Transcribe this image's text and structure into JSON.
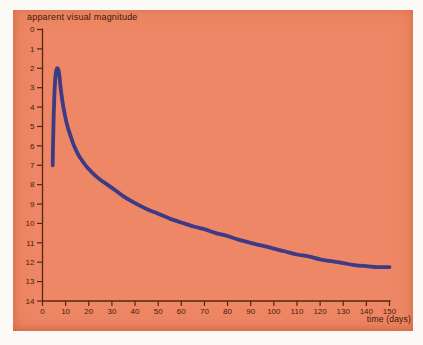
{
  "figure": {
    "page_bg_color": "#fbfaf7",
    "panel_color": "#ee8765",
    "axis_color": "#5a2410",
    "label_color": "#4a1a0c",
    "curve_color": "#3d3a86"
  },
  "chart_data": {
    "type": "line",
    "title": "",
    "ylabel": "apparent visual magnitude",
    "xlabel": "time (days)",
    "xlim": [
      0,
      150
    ],
    "ylim": [
      0,
      14
    ],
    "y_inverted": true,
    "grid": false,
    "legend": "none",
    "x_ticks": [
      0,
      10,
      20,
      30,
      40,
      50,
      60,
      70,
      80,
      90,
      100,
      110,
      120,
      130,
      140,
      150
    ],
    "y_ticks": [
      0,
      1,
      2,
      3,
      4,
      5,
      6,
      7,
      8,
      9,
      10,
      11,
      12,
      13,
      14
    ],
    "series": [
      {
        "name": "nova-light-curve",
        "points": [
          [
            4.4,
            7.0
          ],
          [
            4.5,
            6.3
          ],
          [
            4.65,
            5.4
          ],
          [
            4.85,
            4.4
          ],
          [
            5.1,
            3.5
          ],
          [
            5.4,
            2.75
          ],
          [
            5.75,
            2.25
          ],
          [
            6.1,
            2.05
          ],
          [
            6.5,
            2.0
          ],
          [
            6.9,
            2.1
          ],
          [
            7.3,
            2.4
          ],
          [
            7.7,
            2.85
          ],
          [
            8.2,
            3.35
          ],
          [
            8.8,
            3.85
          ],
          [
            9.5,
            4.3
          ],
          [
            10.3,
            4.75
          ],
          [
            11.2,
            5.15
          ],
          [
            12.3,
            5.55
          ],
          [
            13.5,
            5.95
          ],
          [
            15,
            6.35
          ],
          [
            16.5,
            6.65
          ],
          [
            18,
            6.9
          ],
          [
            20,
            7.2
          ],
          [
            22.5,
            7.5
          ],
          [
            25,
            7.75
          ],
          [
            28,
            8.0
          ],
          [
            31,
            8.25
          ],
          [
            35,
            8.6
          ],
          [
            40,
            8.95
          ],
          [
            45,
            9.25
          ],
          [
            50,
            9.5
          ],
          [
            55,
            9.75
          ],
          [
            60,
            9.95
          ],
          [
            65,
            10.15
          ],
          [
            70,
            10.3
          ],
          [
            75,
            10.5
          ],
          [
            80,
            10.65
          ],
          [
            85,
            10.85
          ],
          [
            90,
            11.0
          ],
          [
            95,
            11.15
          ],
          [
            100,
            11.3
          ],
          [
            105,
            11.45
          ],
          [
            110,
            11.6
          ],
          [
            115,
            11.7
          ],
          [
            120,
            11.85
          ],
          [
            125,
            11.95
          ],
          [
            130,
            12.05
          ],
          [
            135,
            12.15
          ],
          [
            140,
            12.2
          ],
          [
            145,
            12.25
          ],
          [
            150,
            12.25
          ]
        ]
      }
    ]
  }
}
